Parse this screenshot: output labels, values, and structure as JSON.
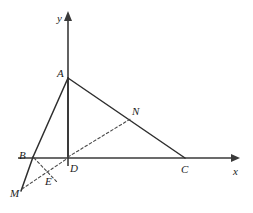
{
  "figure": {
    "background_color": "#ffffff",
    "line_color": "#2e2e2e",
    "axis_color": "#3a3a3a",
    "dash_color": "#4a4a4a",
    "width": 253,
    "height": 213
  },
  "axes": {
    "x": {
      "label": "x",
      "label_x": 233,
      "label_y": 166,
      "start_x": 18,
      "end_x": 240,
      "y": 158,
      "arrow": "right"
    },
    "y": {
      "label": "y",
      "label_x": 57,
      "label_y": 13,
      "x": 68,
      "start_y": 166,
      "end_y": 12,
      "arrow": "up"
    }
  },
  "points": [
    {
      "name": "A",
      "label": "A",
      "x": 68,
      "y": 78,
      "label_x": 57,
      "label_y": 68
    },
    {
      "name": "B",
      "label": "B",
      "x": 33,
      "y": 157,
      "label_x": 19,
      "label_y": 150
    },
    {
      "name": "C",
      "label": "C",
      "x": 185,
      "y": 158,
      "label_x": 181,
      "label_y": 164
    },
    {
      "name": "D",
      "label": "D",
      "x": 68,
      "y": 158,
      "label_x": 70,
      "label_y": 163
    },
    {
      "name": "N",
      "label": "N",
      "x": 130,
      "y": 120,
      "label_x": 132,
      "label_y": 106
    },
    {
      "name": "E",
      "label": "E",
      "x": 48,
      "y": 177,
      "label_x": 45,
      "label_y": 176
    },
    {
      "name": "M",
      "label": "M",
      "x": 21,
      "y": 190,
      "label_x": 10,
      "label_y": 188
    }
  ],
  "solid_segments": [
    {
      "name": "segment-A-B",
      "from": "A",
      "to": "B",
      "x1": 68,
      "y1": 78,
      "x2": 33,
      "y2": 157
    },
    {
      "name": "segment-B-M",
      "from": "B",
      "to": "M",
      "x1": 33,
      "y1": 157,
      "x2": 21,
      "y2": 191
    },
    {
      "name": "segment-A-C",
      "from": "A",
      "to": "C",
      "x1": 68,
      "y1": 78,
      "x2": 185,
      "y2": 158
    },
    {
      "name": "segment-A-D",
      "from": "A",
      "to": "D",
      "x1": 68,
      "y1": 78,
      "x2": 68,
      "y2": 158
    }
  ],
  "dashed_segments": [
    {
      "name": "segment-D-N",
      "from": "D",
      "to": "N",
      "x1": 68,
      "y1": 157,
      "x2": 132,
      "y2": 118
    },
    {
      "name": "segment-M-D",
      "from": "M",
      "to": "D",
      "x1": 22,
      "y1": 189,
      "x2": 68,
      "y2": 158
    },
    {
      "name": "segment-B-E",
      "from": "B",
      "to": "E",
      "x1": 34,
      "y1": 158,
      "x2": 57,
      "y2": 182
    }
  ]
}
